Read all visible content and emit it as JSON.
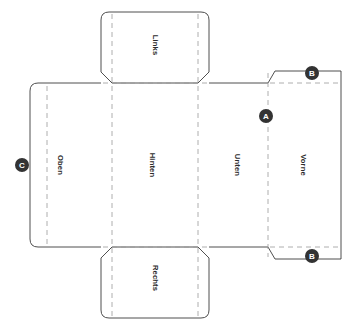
{
  "diagram": {
    "type": "carton-dieline-unfolding-pattern",
    "background_color": "#ffffff",
    "cut_line_color": "#3b3b3b",
    "fold_line_color": "#9a9a9a",
    "marker_fill_color": "#333333",
    "marker_text_color": "#ffffff",
    "panels": [
      {
        "id": "links",
        "label": "Links",
        "role": "top-flap",
        "label_rotation": 90,
        "label_x": 155,
        "label_y": 45
      },
      {
        "id": "oben",
        "label": "Oben",
        "role": "left-panel",
        "label_rotation": 90,
        "label_x": 60,
        "label_y": 165
      },
      {
        "id": "hinten",
        "label": "Hinten",
        "role": "center-panel",
        "label_rotation": 90,
        "label_x": 152,
        "label_y": 165
      },
      {
        "id": "unten",
        "label": "Unten",
        "role": "center-panel",
        "label_rotation": 90,
        "label_x": 237,
        "label_y": 165
      },
      {
        "id": "vorne",
        "label": "Vorne",
        "role": "right-panel",
        "label_rotation": 90,
        "label_x": 303,
        "label_y": 165
      },
      {
        "id": "rechts",
        "label": "Rechts",
        "role": "bottom-flap",
        "label_rotation": 90,
        "label_x": 155,
        "label_y": 278
      }
    ],
    "markers": [
      {
        "id": "marker-b-top",
        "label": "B",
        "x": 312,
        "y": 73,
        "radius": 7
      },
      {
        "id": "marker-a",
        "label": "A",
        "x": 266,
        "y": 116,
        "radius": 7
      },
      {
        "id": "marker-c",
        "label": "C",
        "x": 22,
        "y": 165,
        "radius": 7
      },
      {
        "id": "marker-b-bottom",
        "label": "B",
        "x": 312,
        "y": 256,
        "radius": 7
      }
    ]
  }
}
